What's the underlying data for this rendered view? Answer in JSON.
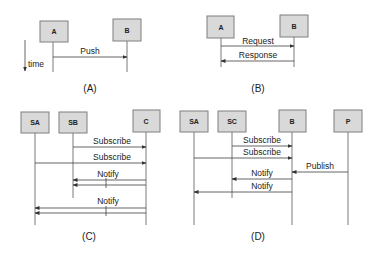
{
  "diagram": {
    "type": "sequence-diagrams",
    "time_axis_label": "time",
    "panels": [
      {
        "caption": "(A)",
        "participants": [
          {
            "label": "A"
          },
          {
            "label": "B"
          }
        ],
        "messages": [
          {
            "label": "Push",
            "from": "A",
            "to": "B"
          }
        ]
      },
      {
        "caption": "(B)",
        "participants": [
          {
            "label": "A"
          },
          {
            "label": "B"
          }
        ],
        "messages": [
          {
            "label": "Request",
            "from": "A",
            "to": "B"
          },
          {
            "label": "Response",
            "from": "B",
            "to": "A"
          }
        ]
      },
      {
        "caption": "(C)",
        "participants": [
          {
            "label": "SA"
          },
          {
            "label": "SB"
          },
          {
            "label": "C"
          }
        ],
        "messages": [
          {
            "label": "Subscribe",
            "from": "SB",
            "to": "C"
          },
          {
            "label": "Subscribe",
            "from": "SA",
            "to": "C"
          },
          {
            "label": "Notify",
            "from": "C",
            "to": "SB"
          },
          {
            "label": "Notify",
            "from": "C",
            "to": "SA"
          }
        ]
      },
      {
        "caption": "(D)",
        "participants": [
          {
            "label": "SA"
          },
          {
            "label": "SC"
          },
          {
            "label": "B"
          },
          {
            "label": "P"
          }
        ],
        "messages": [
          {
            "label": "Subscribe",
            "from": "SC",
            "to": "B"
          },
          {
            "label": "Subscribe",
            "from": "SA",
            "to": "B"
          },
          {
            "label": "Publish",
            "from": "P",
            "to": "B"
          },
          {
            "label": "Notify",
            "from": "B",
            "to": "SC"
          },
          {
            "label": "Notify",
            "from": "B",
            "to": "SA"
          }
        ]
      }
    ]
  }
}
